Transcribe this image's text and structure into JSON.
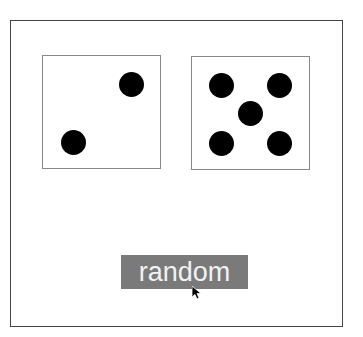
{
  "dice": [
    {
      "value": 2,
      "pips": [
        [
          88,
          83
        ],
        [
          30,
          141
        ]
      ]
    },
    {
      "value": 5,
      "pips": [
        [
          29,
          83
        ],
        [
          87,
          83
        ],
        [
          58,
          111
        ],
        [
          29,
          141
        ],
        [
          87,
          141
        ]
      ]
    }
  ],
  "button": {
    "label": "random"
  },
  "colors": {
    "button_bg": "#7a7a7a",
    "button_text": "#f2f2f2",
    "pip": "#000000"
  }
}
